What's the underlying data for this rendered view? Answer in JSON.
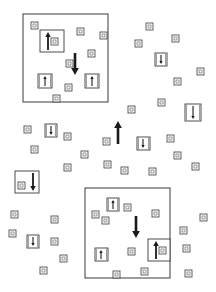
{
  "diagram": {
    "colors": {
      "line": "#3a3a3a",
      "fill": "#ffffff",
      "arrow": "#1a1a1a"
    },
    "large_regions": [
      {
        "id": "region-top-left",
        "x": 23,
        "y": 14,
        "w": 85,
        "h": 88
      },
      {
        "id": "region-bottom-right",
        "x": 85,
        "y": 188,
        "w": 85,
        "h": 90
      }
    ],
    "big_arrows": [
      {
        "id": "big-arrow-top-left-down",
        "x": 75,
        "y1": 53,
        "y2": 75,
        "direction": "down"
      },
      {
        "id": "big-arrow-center-up",
        "x": 118,
        "y1": 144,
        "y2": 121,
        "direction": "up"
      },
      {
        "id": "big-arrow-bottom-right-down",
        "x": 136,
        "y1": 216,
        "y2": 238,
        "direction": "down"
      }
    ],
    "arrow_boxes": [
      {
        "x": 40,
        "y": 30,
        "w": 24,
        "h": 22,
        "direction": "up",
        "arrow_x": 48,
        "inner_cell": true
      },
      {
        "x": 38,
        "y": 74,
        "w": 14,
        "h": 14,
        "direction": "up",
        "arrow_x": 45
      },
      {
        "x": 85,
        "y": 74,
        "w": 14,
        "h": 14,
        "direction": "up",
        "arrow_x": 92
      },
      {
        "x": 155,
        "y": 53,
        "w": 12,
        "h": 13,
        "direction": "down",
        "arrow_x": 161
      },
      {
        "x": 185,
        "y": 104,
        "w": 16,
        "h": 17,
        "direction": "down",
        "arrow_x": 193
      },
      {
        "x": 45,
        "y": 124,
        "w": 12,
        "h": 13,
        "direction": "down",
        "arrow_x": 51
      },
      {
        "x": 137,
        "y": 137,
        "w": 13,
        "h": 13,
        "direction": "down",
        "arrow_x": 143
      },
      {
        "x": 15,
        "y": 171,
        "w": 24,
        "h": 22,
        "direction": "down",
        "arrow_x": 33,
        "inner_cell": true
      },
      {
        "x": 107,
        "y": 198,
        "w": 12,
        "h": 13,
        "direction": "up",
        "arrow_x": 113
      },
      {
        "x": 95,
        "y": 248,
        "w": 13,
        "h": 13,
        "direction": "up",
        "arrow_x": 101
      },
      {
        "x": 148,
        "y": 239,
        "w": 22,
        "h": 22,
        "direction": "up",
        "arrow_x": 156,
        "inner_cell": true
      },
      {
        "x": 27,
        "y": 235,
        "w": 12,
        "h": 13,
        "direction": "down",
        "arrow_x": 33
      }
    ],
    "small_cells": [
      [
        31,
        22
      ],
      [
        77,
        28
      ],
      [
        100,
        32
      ],
      [
        88,
        50
      ],
      [
        66,
        60
      ],
      [
        65,
        84
      ],
      [
        53,
        95
      ],
      [
        146,
        23
      ],
      [
        135,
        40
      ],
      [
        172,
        35
      ],
      [
        197,
        68
      ],
      [
        174,
        78
      ],
      [
        158,
        99
      ],
      [
        128,
        106
      ],
      [
        24,
        126
      ],
      [
        64,
        133
      ],
      [
        31,
        146
      ],
      [
        103,
        138
      ],
      [
        167,
        135
      ],
      [
        81,
        151
      ],
      [
        174,
        152
      ],
      [
        104,
        161
      ],
      [
        64,
        164
      ],
      [
        149,
        168
      ],
      [
        121,
        167
      ],
      [
        192,
        163
      ],
      [
        124,
        204
      ],
      [
        102,
        217
      ],
      [
        152,
        210
      ],
      [
        180,
        227
      ],
      [
        183,
        245
      ],
      [
        128,
        248
      ],
      [
        200,
        214
      ],
      [
        11,
        211
      ],
      [
        51,
        216
      ],
      [
        92,
        211
      ],
      [
        9,
        230
      ],
      [
        51,
        238
      ],
      [
        60,
        255
      ],
      [
        40,
        267
      ],
      [
        141,
        268
      ],
      [
        185,
        270
      ],
      [
        113,
        271
      ]
    ],
    "cell_size": 7
  }
}
